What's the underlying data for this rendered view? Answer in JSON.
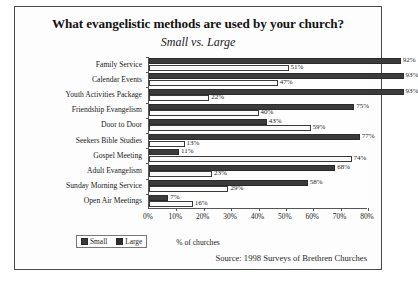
{
  "chart_data": {
    "type": "bar",
    "orientation": "horizontal",
    "title": "What evangelistic methods are used by your church?",
    "subtitle": "Small vs. Large",
    "xlabel": "% of churches",
    "ylabel": "",
    "xlim": [
      0,
      80
    ],
    "xticks": [
      "0%",
      "10%",
      "20%",
      "30%",
      "40%",
      "50%",
      "60%",
      "70%",
      "80%"
    ],
    "xtick_values": [
      0,
      10,
      20,
      30,
      40,
      50,
      60,
      70,
      80
    ],
    "grid": false,
    "legend_position": "bottom-left",
    "categories": [
      "Family Service",
      "Calendar Events",
      "Youth Activities Package",
      "Friendship Evangelism",
      "Door to Door",
      "Seekers Bible Studies",
      "Gospel Meeting",
      "Adult Evangelism",
      "Sunday Morning Service",
      "Open Air Meetings"
    ],
    "series": [
      {
        "name": "Small",
        "color": "#3b3b3b",
        "values": [
          92,
          93,
          93,
          75,
          43,
          77,
          11,
          68,
          58,
          7
        ],
        "labels": [
          "92%",
          "93%",
          "93%",
          "75%",
          "43%",
          "77%",
          "11%",
          "68%",
          "58%",
          "7%"
        ]
      },
      {
        "name": "Large",
        "color": "#fafafa",
        "values": [
          51,
          47,
          22,
          40,
          59,
          13,
          74,
          23,
          29,
          16
        ],
        "labels": [
          "51%",
          "47%",
          "22%",
          "40%",
          "59%",
          "13%",
          "74%",
          "23%",
          "29%",
          "16%"
        ]
      }
    ],
    "source": "Source: 1998 Surveys of Brethren Churches"
  }
}
